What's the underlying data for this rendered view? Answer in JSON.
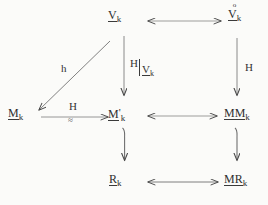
{
  "diagram": {
    "type": "commutative-diagram",
    "background_color": "#fbfbf9",
    "ink_color": "#3a3a3a",
    "nodes": [
      {
        "id": "v-k",
        "name": "node-v-k",
        "base": "V",
        "subscript": "k",
        "accent": "",
        "prime": "",
        "underlined": true,
        "row": "top",
        "column": "center"
      },
      {
        "id": "v-circ-k",
        "name": "node-v-circ-k",
        "base": "V",
        "subscript": "k",
        "accent": "o",
        "prime": "",
        "underlined": true,
        "row": "top",
        "column": "right"
      },
      {
        "id": "m-k",
        "name": "node-m-k",
        "base": "M",
        "subscript": "k",
        "accent": "",
        "prime": "",
        "underlined": true,
        "row": "middle",
        "column": "left"
      },
      {
        "id": "m-prime-k",
        "name": "node-m-prime-k",
        "base": "M",
        "subscript": "k",
        "accent": "",
        "prime": "'",
        "underlined": true,
        "row": "middle",
        "column": "center"
      },
      {
        "id": "mm-k",
        "name": "node-mm-k",
        "base": "MM",
        "subscript": "k",
        "accent": "",
        "prime": "",
        "underlined": true,
        "row": "middle",
        "column": "right"
      },
      {
        "id": "r-k",
        "name": "node-r-k",
        "base": "R",
        "subscript": "k",
        "accent": "",
        "prime": "",
        "underlined": true,
        "row": "bottom",
        "column": "center"
      },
      {
        "id": "mr-k",
        "name": "node-mr-k",
        "base": "MR",
        "subscript": "k",
        "accent": "",
        "prime": "",
        "underlined": true,
        "row": "bottom",
        "column": "right"
      }
    ],
    "edges": [
      {
        "id": "edge-top-horizontal",
        "from": "v-k",
        "to": "v-circ-k",
        "style": "double-headed",
        "orientation": "horizontal",
        "label": ""
      },
      {
        "id": "edge-middle-horizontal-right",
        "from": "m-prime-k",
        "to": "mm-k",
        "style": "double-headed",
        "orientation": "horizontal",
        "label": ""
      },
      {
        "id": "edge-bottom-horizontal",
        "from": "r-k",
        "to": "mr-k",
        "style": "double-headed",
        "orientation": "horizontal",
        "label": ""
      },
      {
        "id": "edge-m-to-mprime",
        "from": "m-k",
        "to": "m-prime-k",
        "style": "single-headed",
        "orientation": "horizontal",
        "label": "H",
        "sublabel": "≈"
      },
      {
        "id": "edge-v-to-m-diagonal",
        "from": "v-k",
        "to": "m-k",
        "style": "single-headed",
        "orientation": "diagonal",
        "label": "h"
      },
      {
        "id": "edge-v-to-mprime",
        "from": "v-k",
        "to": "m-prime-k",
        "style": "single-headed",
        "orientation": "vertical",
        "label": "H restricted to V_k"
      },
      {
        "id": "edge-vcirc-to-mm",
        "from": "v-circ-k",
        "to": "mm-k",
        "style": "single-headed",
        "orientation": "vertical",
        "label": "H"
      },
      {
        "id": "edge-mprime-to-r",
        "from": "m-prime-k",
        "to": "r-k",
        "style": "single-headed",
        "orientation": "vertical",
        "label": ""
      },
      {
        "id": "edge-mm-to-mr",
        "from": "mm-k",
        "to": "mr-k",
        "style": "single-headed",
        "orientation": "vertical",
        "label": ""
      }
    ],
    "labels": {
      "h_lower": "h",
      "h_upper_horizontal": "H",
      "approx_symbol": "≈",
      "h_right_column": "H",
      "restriction_function": "H",
      "restriction_bar": "|",
      "restriction_domain_base": "V",
      "restriction_domain_sub": "k",
      "ring_accent": "o",
      "prime_mark": "'"
    }
  }
}
